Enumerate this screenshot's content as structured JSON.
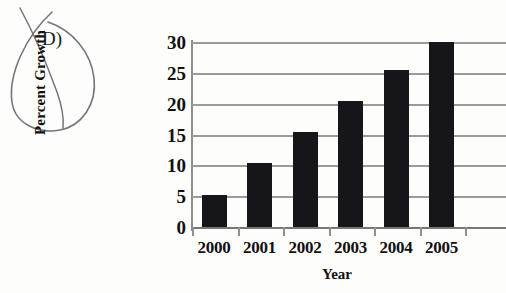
{
  "annotation": {
    "letter": "D)",
    "mark": "handwritten-oval-loop",
    "ink_color": "#6f6f73"
  },
  "chart_data": {
    "type": "bar",
    "title": "",
    "subtitle": "",
    "xlabel": "Year",
    "ylabel": "Percent Growth",
    "categories": [
      "2000",
      "2001",
      "2002",
      "2003",
      "2004",
      "2005"
    ],
    "values": [
      5.2,
      10.4,
      15.4,
      20.4,
      25.4,
      30.0
    ],
    "yticks": [
      0,
      5,
      10,
      15,
      20,
      25,
      30
    ],
    "ytick_labels": [
      "0",
      "5",
      "10",
      "15",
      "20",
      "25",
      "30"
    ],
    "ylim": [
      0,
      30
    ],
    "grid": true,
    "grid_axis": "y",
    "legend": false,
    "legend_position": "none",
    "bar_color": "#16161a",
    "grid_color": "#9a9a9a",
    "axis_color": "#8d8d8d",
    "clipped_right_edge": true
  }
}
